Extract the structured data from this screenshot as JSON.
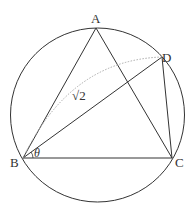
{
  "diagram": {
    "type": "geometry",
    "circle": {
      "cx": 97.5,
      "cy": 115,
      "r": 87
    },
    "points": {
      "A": {
        "label": "A",
        "x": 96,
        "y": 28
      },
      "B": {
        "label": "B",
        "x": 23,
        "y": 158
      },
      "C": {
        "label": "C",
        "x": 172,
        "y": 158
      },
      "D": {
        "label": "D",
        "x": 162,
        "y": 57
      }
    },
    "segments": [
      "AB",
      "AC",
      "BC",
      "BD",
      "DC"
    ],
    "labels": {
      "length_BD": "√2",
      "angle_B": "θ"
    },
    "colors": {
      "line": "#333333",
      "dotted": "#aaaaaa"
    }
  }
}
